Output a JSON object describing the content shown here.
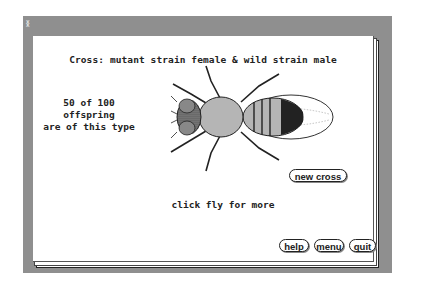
{
  "window": {
    "close_glyph": "⁑"
  },
  "screen": {
    "title": "Cross: mutant strain female & wild strain male",
    "offspring_info": [
      "50 of 100 offspring",
      "are of this type"
    ],
    "hint": "click fly for more",
    "fly_image": "fly-icon"
  },
  "buttons": {
    "new_cross": "new cross",
    "help": "help",
    "menu": "menu",
    "quit": "quit"
  }
}
